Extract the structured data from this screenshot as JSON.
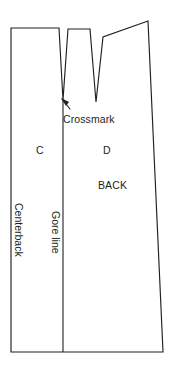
{
  "figure": {
    "name": "sewing-pattern-back-piece",
    "background_color": "#ffffff",
    "line_color": "#231f20",
    "width": 174,
    "height": 368
  },
  "labels": {
    "crossmark": "Crossmark",
    "panel_c": "C",
    "panel_d": "D",
    "back": "BACK",
    "centerback": "Centerback",
    "gore_line": "Gore line"
  },
  "icons": {
    "pointer_arrow": "arrow-up-left-icon"
  },
  "geometry": {
    "outline_points": "11,28 59,28 63,100 68,29 90,29 96,102 103,37 148,21 163,352 11,352",
    "gore_line": "63,100 63,352",
    "arrow_shaft": "70,109 62,99",
    "arrow_head": "61,98 69,102 66,106"
  }
}
